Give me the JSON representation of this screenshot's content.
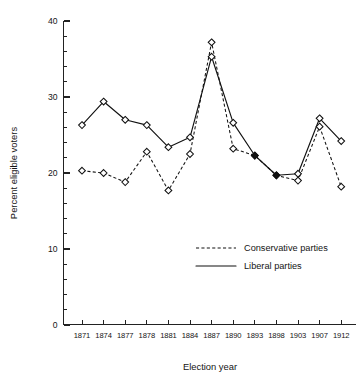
{
  "chart_data": {
    "type": "line",
    "title": "",
    "subtitle": "",
    "xlabel": "Election year",
    "ylabel": "Percent eligible voters",
    "categories": [
      "1871",
      "1874",
      "1877",
      "1878",
      "1881",
      "1884",
      "1887",
      "1890",
      "1893",
      "1898",
      "1903",
      "1907",
      "1912"
    ],
    "x_tick_labels": [
      "1871",
      "1874",
      "1877",
      "1878",
      "1881",
      "1884",
      "1887",
      "1890",
      "1893",
      "1898",
      "1903",
      "1907",
      "1912"
    ],
    "y_tick_labels": [
      "0",
      "10",
      "20",
      "30",
      "40"
    ],
    "y_ticks": [
      0,
      10,
      20,
      30,
      40
    ],
    "y_minor_tick_step": 2,
    "ylim": [
      0,
      40
    ],
    "grid": false,
    "legend_position": "lower-right-inside",
    "series": [
      {
        "name": "Conservative parties",
        "style": "dashed",
        "marker": "diamond-open",
        "values": [
          20.3,
          20.0,
          18.8,
          22.8,
          17.7,
          22.5,
          37.2,
          23.2,
          22.3,
          19.7,
          19.0,
          26.1,
          18.2
        ]
      },
      {
        "name": "Liberal parties",
        "style": "solid",
        "marker": "diamond-open",
        "values": [
          26.3,
          29.4,
          27.0,
          26.3,
          23.4,
          24.7,
          35.3,
          26.6,
          22.3,
          19.7,
          19.9,
          27.2,
          24.2
        ]
      }
    ],
    "overlapping_points": [
      "1893",
      "1898"
    ],
    "colors": {
      "axis": "#222222",
      "series_conservative": "#111111",
      "series_liberal": "#111111",
      "background": "#ffffff",
      "text": "#141414"
    }
  },
  "legend": {
    "entries": [
      {
        "label": "Conservative parties",
        "style": "dashed"
      },
      {
        "label": "Liberal parties",
        "style": "solid"
      }
    ]
  }
}
